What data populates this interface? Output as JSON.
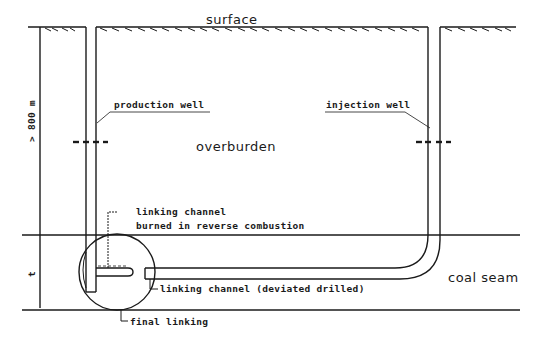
{
  "diagram": {
    "labels": {
      "surface": "surface",
      "overburden": "overburden",
      "coal_seam": "coal seam",
      "production_well": "production well",
      "injection_well": "injection well",
      "linking_channel_reverse_line1": "linking channel",
      "linking_channel_reverse_line2": "burned in reverse combustion",
      "linking_channel_deviated": "linking channel (deviated drilled)",
      "final_linking": "final linking",
      "depth_dimension": "> 800 m",
      "seam_thickness_dimension": "t"
    },
    "colors": {
      "ink": "#1a1a1a",
      "background": "#ffffff"
    }
  }
}
